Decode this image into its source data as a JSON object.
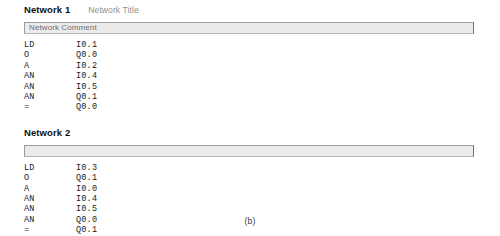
{
  "figure": {
    "caption": "(b)"
  },
  "editor": {
    "networks": [
      {
        "label": "Network 1",
        "title": "Network Title",
        "comment": "Network Comment",
        "instructions": [
          {
            "operator": "LD",
            "operand": "I0.1"
          },
          {
            "operator": "O",
            "operand": "Q0.0"
          },
          {
            "operator": "A",
            "operand": "I0.2"
          },
          {
            "operator": "AN",
            "operand": "I0.4"
          },
          {
            "operator": "AN",
            "operand": "I0.5"
          },
          {
            "operator": "AN",
            "operand": "Q0.1"
          },
          {
            "operator": "=",
            "operand": "Q0.0"
          }
        ]
      },
      {
        "label": "Network 2",
        "title": "",
        "comment": "",
        "instructions": [
          {
            "operator": "LD",
            "operand": "I0.3"
          },
          {
            "operator": "O",
            "operand": "Q0.1"
          },
          {
            "operator": "A",
            "operand": "I0.0"
          },
          {
            "operator": "AN",
            "operand": "I0.4"
          },
          {
            "operator": "AN",
            "operand": "I0.5"
          },
          {
            "operator": "AN",
            "operand": "Q0.0"
          },
          {
            "operator": "=",
            "operand": "Q0.1"
          }
        ]
      }
    ]
  }
}
